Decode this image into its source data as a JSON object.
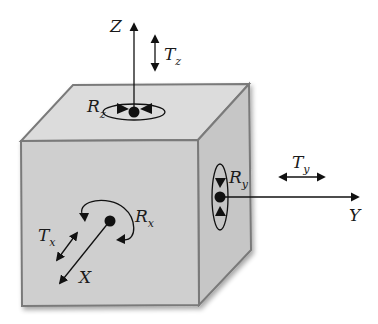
{
  "diagram": {
    "colors": {
      "front_face": "#cfcfcf",
      "top_face": "#dcdcdc",
      "side_face": "#c6c6c6",
      "edge": "#7a7a7a",
      "ink": "#111111"
    },
    "axes": {
      "z": {
        "label": "Z",
        "translation": {
          "main": "T",
          "sub": "z"
        },
        "rotation": {
          "main": "R",
          "sub": "z"
        }
      },
      "y": {
        "label": "Y",
        "translation": {
          "main": "T",
          "sub": "y"
        },
        "rotation": {
          "main": "R",
          "sub": "y"
        }
      },
      "x": {
        "label": "X",
        "translation": {
          "main": "T",
          "sub": "x"
        },
        "rotation": {
          "main": "R",
          "sub": "x"
        }
      }
    }
  }
}
